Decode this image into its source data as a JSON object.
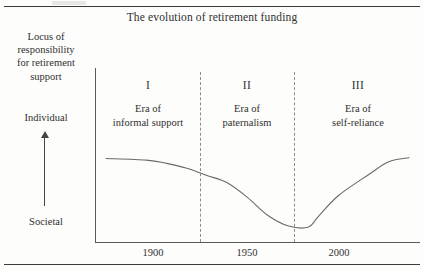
{
  "figure": {
    "title": "The evolution of retirement funding",
    "y_axis": {
      "caption_lines": [
        "Locus of",
        "responsibility",
        "for retirement",
        "support"
      ],
      "top_label": "Individual",
      "bottom_label": "Societal",
      "arrow_icon": "up-arrow-icon"
    },
    "eras": [
      {
        "numeral": "I",
        "line1": "Era of",
        "line2": "informal support"
      },
      {
        "numeral": "II",
        "line1": "Era of",
        "line2": "paternalism"
      },
      {
        "numeral": "III",
        "line1": "Era of",
        "line2": "self-reliance"
      }
    ],
    "x_ticks": [
      "1900",
      "1950",
      "2000"
    ]
  },
  "chart_data": {
    "type": "line",
    "title": "The evolution of retirement funding",
    "xlabel": "",
    "ylabel": "Locus of responsibility for retirement support",
    "x": [
      1870,
      1890,
      1900,
      1910,
      1920,
      1930,
      1940,
      1950,
      1960,
      1970,
      1975,
      1985,
      2000,
      2010,
      2020
    ],
    "values": [
      0.92,
      0.9,
      0.86,
      0.8,
      0.71,
      0.62,
      0.44,
      0.22,
      0.09,
      0.07,
      0.2,
      0.46,
      0.72,
      0.88,
      0.93
    ],
    "ylim": [
      0,
      1
    ],
    "xlim": [
      1865,
      2025
    ],
    "ytick_labels": [
      "Societal",
      "Individual"
    ],
    "ytick_values": [
      0,
      1
    ],
    "xtick_values": [
      1900,
      1950,
      2000
    ],
    "xtick_labels": [
      "1900",
      "1950",
      "2000"
    ],
    "grid": false,
    "legend": "none",
    "annotations": [
      {
        "label": "I — Era of informal support",
        "x_range": [
          1865,
          1928
        ]
      },
      {
        "label": "II — Era of paternalism",
        "x_range": [
          1928,
          1975
        ]
      },
      {
        "label": "III — Era of self-reliance",
        "x_range": [
          1975,
          2025
        ]
      }
    ],
    "vertical_dividers": [
      1928,
      1975
    ],
    "line_color": "#6a6a68",
    "axis_color": "#5a5a58",
    "divider_color": "#8d8d8a"
  }
}
